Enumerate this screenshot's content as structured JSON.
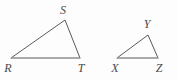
{
  "figure": {
    "background_color": "#fdfdfd",
    "stroke_color": "#5a5a5a",
    "base_stroke_color": "#8e8e8e",
    "label_color": "#4a4a4a",
    "width": 178,
    "height": 79
  },
  "triangles": [
    {
      "name": "triangle-RST",
      "label_text": "RST",
      "vertices": [
        {
          "label": "R",
          "x": 11,
          "y": 58,
          "label_x": 8,
          "label_y": 68
        },
        {
          "label": "S",
          "x": 65,
          "y": 20,
          "label_x": 63,
          "label_y": 10
        },
        {
          "label": "T",
          "x": 80,
          "y": 58,
          "label_x": 81,
          "label_y": 68
        }
      ],
      "path": "M 11 58 L 65 20 L 80 58",
      "base_path": "M 11 58 L 80 58"
    },
    {
      "name": "triangle-XYZ",
      "label_text": "XYZ",
      "vertices": [
        {
          "label": "X",
          "x": 117,
          "y": 58,
          "label_x": 115,
          "label_y": 68
        },
        {
          "label": "Y",
          "x": 148,
          "y": 35,
          "label_x": 147,
          "label_y": 24
        },
        {
          "label": "Z",
          "x": 158,
          "y": 58,
          "label_x": 159,
          "label_y": 68
        }
      ],
      "path": "M 117 58 L 148 35 L 158 58",
      "base_path": "M 117 58 L 158 58"
    }
  ]
}
